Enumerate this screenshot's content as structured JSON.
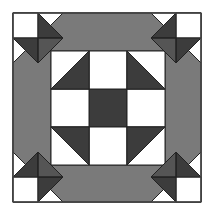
{
  "figure": {
    "colors": {
      "background": "#ffffff",
      "light": "#ffffff",
      "medium": "#7a7a7a",
      "dark": "#3c3c3c",
      "outline": "#222222"
    },
    "structure": {
      "outer_square": [
        13,
        13,
        201,
        202
      ],
      "inner_nine_patch": {
        "x0": 51,
        "y0": 51,
        "cell": 38
      },
      "center_cell": "dark",
      "edge_cells": "light",
      "corner_cells": "half-square triangles, dark half toward center",
      "frame": "medium gray octagonal ring",
      "corners": "star units: light square with dark triangles"
    }
  }
}
